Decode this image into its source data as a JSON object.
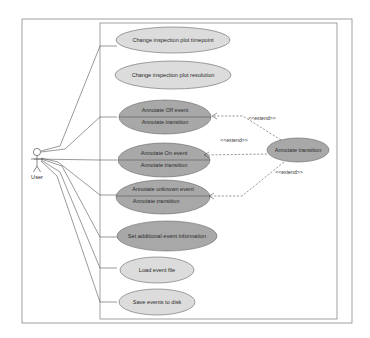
{
  "diagram": {
    "type": "uml-use-case",
    "colors": {
      "light_fill": "#d9d9d9",
      "dark_fill": "#a6a6a6",
      "stroke": "#555555",
      "frame": "#888888",
      "background": "#ffffff"
    },
    "actor": {
      "label": "User"
    },
    "use_cases": [
      {
        "id": "uc1",
        "label": "Change inspection plot timepoint",
        "style": "light"
      },
      {
        "id": "uc2",
        "label": "Change inspection plot resolution",
        "style": "light"
      },
      {
        "id": "uc3",
        "label": "Annotate Off event",
        "extension_point": "Annotate transition",
        "style": "dark"
      },
      {
        "id": "uc4",
        "label": "Annotate On event",
        "extension_point": "Annotate transition",
        "style": "dark"
      },
      {
        "id": "uc5",
        "label": "Annotate unknown event",
        "extension_point": "Annotate transition",
        "style": "dark"
      },
      {
        "id": "uc6",
        "label": "Set additional event information",
        "style": "dark"
      },
      {
        "id": "uc7",
        "label": "Load event file",
        "style": "light"
      },
      {
        "id": "uc8",
        "label": "Save events to disk",
        "style": "light"
      }
    ],
    "extension": {
      "label": "Annotate transition",
      "style": "dark"
    },
    "relations": [
      {
        "from": "extension",
        "to": "uc3",
        "stereotype": "<<extend>>"
      },
      {
        "from": "extension",
        "to": "uc4",
        "stereotype": "<<extend>>"
      },
      {
        "from": "extension",
        "to": "uc5",
        "stereotype": "<<extend>>"
      }
    ]
  }
}
